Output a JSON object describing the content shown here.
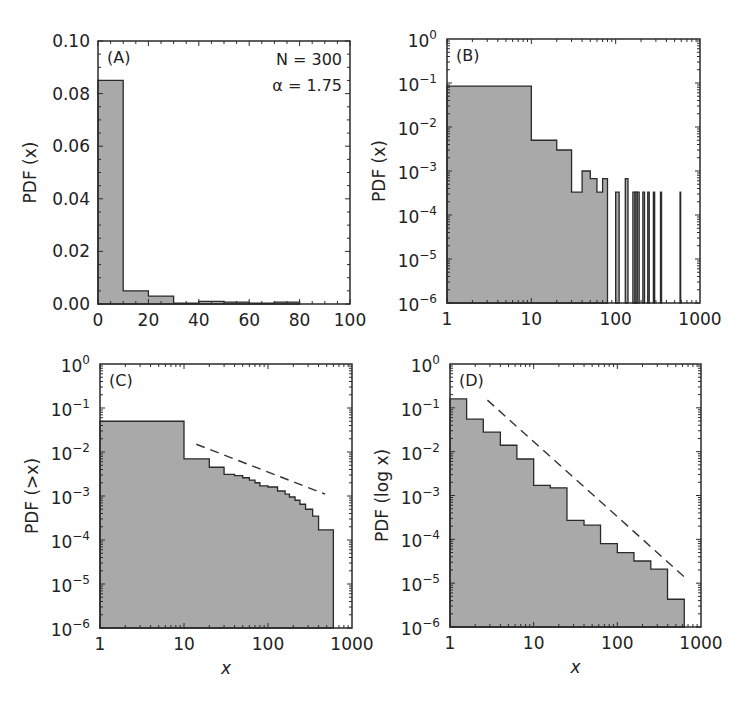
{
  "chart_data": [
    {
      "panel": "(A)",
      "type": "bar",
      "title": "",
      "xlabel": "",
      "ylabel": "PDF (x)",
      "xscale": "linear",
      "yscale": "linear",
      "xlim": [
        0,
        100
      ],
      "ylim": [
        0,
        0.1
      ],
      "xticks": [
        "0",
        "20",
        "40",
        "60",
        "80",
        "100"
      ],
      "yticks": [
        "0.00",
        "0.02",
        "0.04",
        "0.06",
        "0.08",
        "0.10"
      ],
      "annotations": [
        "N = 300",
        "α = 1.75"
      ],
      "bins": [
        [
          0,
          10
        ],
        [
          10,
          20
        ],
        [
          20,
          30
        ],
        [
          30,
          40
        ],
        [
          40,
          50
        ],
        [
          50,
          60
        ],
        [
          60,
          70
        ],
        [
          70,
          80
        ]
      ],
      "values": [
        0.085,
        0.005,
        0.003,
        0.0003,
        0.001,
        0.0007,
        0.0003,
        0.0007
      ],
      "grid": false,
      "fill": "#a9a9a9"
    },
    {
      "panel": "(B)",
      "type": "bar",
      "title": "",
      "xlabel": "",
      "ylabel": "PDF (x)",
      "xscale": "log",
      "yscale": "log",
      "xlim": [
        1,
        1000
      ],
      "ylim": [
        1e-06,
        1
      ],
      "xticks": [
        "1",
        "10",
        "100",
        "1000"
      ],
      "yticks": [
        "10^-6",
        "10^-5",
        "10^-4",
        "10^-3",
        "10^-2",
        "10^-1",
        "10^0"
      ],
      "bins": [
        [
          1,
          10
        ],
        [
          10,
          20
        ],
        [
          20,
          30
        ],
        [
          30,
          40
        ],
        [
          40,
          50
        ],
        [
          50,
          60
        ],
        [
          60,
          70
        ],
        [
          70,
          80
        ],
        [
          100,
          110
        ],
        [
          130,
          140
        ],
        [
          160,
          170
        ],
        [
          170,
          180
        ],
        [
          180,
          190
        ],
        [
          210,
          220
        ],
        [
          240,
          250
        ],
        [
          280,
          290
        ],
        [
          340,
          350
        ],
        [
          580,
          590
        ]
      ],
      "values": [
        0.085,
        0.005,
        0.003,
        0.00033,
        0.001,
        0.00067,
        0.00033,
        0.00067,
        0.00033,
        0.00067,
        0.00033,
        0.00033,
        0.00033,
        0.00033,
        0.00033,
        0.00033,
        0.00033,
        0.00033
      ],
      "grid": false,
      "fill": "#a9a9a9"
    },
    {
      "panel": "(C)",
      "type": "area",
      "title": "",
      "xlabel": "x",
      "ylabel": "PDF (>x)",
      "xscale": "log",
      "yscale": "log",
      "xlim": [
        1,
        1000
      ],
      "ylim": [
        1e-06,
        1
      ],
      "xticks": [
        "1",
        "10",
        "100",
        "1000"
      ],
      "yticks": [
        "10^-6",
        "10^-5",
        "10^-4",
        "10^-3",
        "10^-2",
        "10^-1",
        "10^0"
      ],
      "steps_x": [
        1,
        10,
        20,
        30,
        40,
        50,
        60,
        70,
        80,
        100,
        130,
        160,
        180,
        210,
        240,
        280,
        340,
        400,
        600
      ],
      "steps_y": [
        0.05,
        0.007,
        0.0045,
        0.0031,
        0.0029,
        0.0026,
        0.0023,
        0.002,
        0.0017,
        0.0016,
        0.0013,
        0.0011,
        0.00095,
        0.0008,
        0.00065,
        0.0005,
        0.00035,
        0.00017
      ],
      "reference_line": {
        "style": "dashed",
        "x": [
          14,
          480
        ],
        "y": [
          0.015,
          0.0011
        ]
      },
      "grid": false,
      "fill": "#a9a9a9"
    },
    {
      "panel": "(D)",
      "type": "bar",
      "title": "",
      "xlabel": "x",
      "ylabel": "PDF (log x)",
      "xscale": "log",
      "yscale": "log",
      "xlim": [
        1,
        1000
      ],
      "ylim": [
        1e-06,
        1
      ],
      "xticks": [
        "1",
        "10",
        "100",
        "1000"
      ],
      "yticks": [
        "10^-6",
        "10^-5",
        "10^-4",
        "10^-3",
        "10^-2",
        "10^-1",
        "10^0"
      ],
      "bin_edges": [
        1,
        1.58,
        2.5,
        4,
        6.3,
        10,
        15.8,
        25,
        40,
        63,
        100,
        158,
        251,
        398,
        631
      ],
      "values": [
        0.16,
        0.055,
        0.028,
        0.014,
        0.0068,
        0.0017,
        0.0015,
        0.00027,
        0.00021,
        8e-05,
        5e-05,
        3.2e-05,
        2.1e-05,
        4.3e-06
      ],
      "reference_line": {
        "style": "dashed",
        "x": [
          2.8,
          630
        ],
        "y": [
          0.15,
          1.4e-05
        ]
      },
      "grid": false,
      "fill": "#a9a9a9"
    }
  ],
  "panels": {
    "a": {
      "label": "(A)",
      "ylabel": "PDF (x)",
      "n_label": "N = 300",
      "alpha_label": "α = 1.75"
    },
    "b": {
      "label": "(B)",
      "ylabel": "PDF (x)"
    },
    "c": {
      "label": "(C)",
      "ylabel": "PDF (>x)",
      "xlabel": "x"
    },
    "d": {
      "label": "(D)",
      "ylabel": "PDF (log x)",
      "xlabel": "x"
    }
  }
}
